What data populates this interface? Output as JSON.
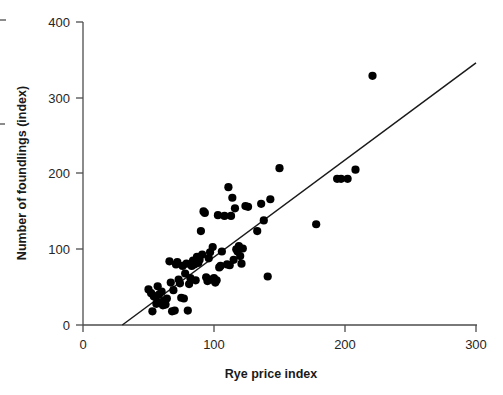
{
  "chart_data": {
    "type": "scatter",
    "title": "",
    "xlabel": "Rye price index",
    "ylabel": "Number of foundlings (index)",
    "xlim": [
      0,
      300
    ],
    "ylim": [
      0,
      400
    ],
    "xticks": [
      0,
      100,
      200,
      300
    ],
    "yticks": [
      0,
      100,
      200,
      300,
      400
    ],
    "xtick_labels": [
      "0",
      "100",
      "200",
      "300"
    ],
    "ytick_labels": [
      "0",
      "100",
      "200",
      "300",
      "400"
    ],
    "grid": false,
    "legend": null,
    "marker": "filled-circle",
    "marker_color": "#000000",
    "series": [
      {
        "name": "foundlings vs rye price",
        "points": [
          [
            50,
            47
          ],
          [
            52,
            42
          ],
          [
            53,
            18
          ],
          [
            54,
            38
          ],
          [
            55,
            37
          ],
          [
            56,
            28
          ],
          [
            57,
            51
          ],
          [
            58,
            40
          ],
          [
            59,
            30
          ],
          [
            60,
            44
          ],
          [
            61,
            26
          ],
          [
            62,
            32
          ],
          [
            63,
            27
          ],
          [
            64,
            35
          ],
          [
            66,
            84
          ],
          [
            67,
            56
          ],
          [
            68,
            18
          ],
          [
            69,
            46
          ],
          [
            70,
            19
          ],
          [
            71,
            80
          ],
          [
            72,
            83
          ],
          [
            73,
            60
          ],
          [
            74,
            55
          ],
          [
            75,
            36
          ],
          [
            76,
            78
          ],
          [
            77,
            35
          ],
          [
            78,
            68
          ],
          [
            79,
            81
          ],
          [
            80,
            19
          ],
          [
            81,
            54
          ],
          [
            82,
            62
          ],
          [
            83,
            78
          ],
          [
            84,
            85
          ],
          [
            85,
            80
          ],
          [
            86,
            59
          ],
          [
            87,
            90
          ],
          [
            88,
            82
          ],
          [
            89,
            86
          ],
          [
            90,
            124
          ],
          [
            91,
            93
          ],
          [
            92,
            150
          ],
          [
            93,
            148
          ],
          [
            94,
            63
          ],
          [
            95,
            58
          ],
          [
            96,
            88
          ],
          [
            97,
            96
          ],
          [
            98,
            60
          ],
          [
            99,
            103
          ],
          [
            100,
            62
          ],
          [
            101,
            56
          ],
          [
            102,
            59
          ],
          [
            103,
            145
          ],
          [
            104,
            76
          ],
          [
            105,
            78
          ],
          [
            106,
            97
          ],
          [
            108,
            144
          ],
          [
            110,
            80
          ],
          [
            111,
            182
          ],
          [
            112,
            79
          ],
          [
            113,
            144
          ],
          [
            114,
            168
          ],
          [
            115,
            86
          ],
          [
            116,
            154
          ],
          [
            117,
            100
          ],
          [
            118,
            97
          ],
          [
            119,
            104
          ],
          [
            120,
            91
          ],
          [
            121,
            81
          ],
          [
            122,
            101
          ],
          [
            124,
            157
          ],
          [
            126,
            156
          ],
          [
            133,
            124
          ],
          [
            136,
            160
          ],
          [
            138,
            138
          ],
          [
            141,
            64
          ],
          [
            143,
            166
          ],
          [
            150,
            207
          ],
          [
            178,
            133
          ],
          [
            194,
            193
          ],
          [
            197,
            193
          ],
          [
            202,
            193
          ],
          [
            208,
            205
          ],
          [
            221,
            329
          ]
        ]
      }
    ],
    "trendline": {
      "name": "linear fit",
      "x_start": 30,
      "y_start": 0,
      "x_end": 300,
      "y_end": 346,
      "color": "#1a1a1a"
    }
  },
  "figure": {
    "background": "#ffffff",
    "axis_color": "#4d4d4d"
  }
}
